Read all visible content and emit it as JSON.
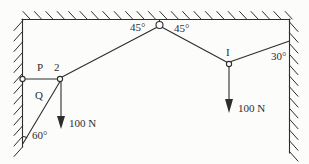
{
  "diagram": {
    "colors": {
      "ink": "#2d2d2d",
      "paper": "#fcfcfb"
    },
    "labels": {
      "point_P": "P",
      "point_2": "2",
      "string_Q": "Q",
      "point_I": "I",
      "angle_left_of_pulley": "45°",
      "angle_right_of_pulley": "45°",
      "angle_at_right_wall": "30°",
      "angle_at_left_wall": "60°",
      "force_at_left_knot": "100 N",
      "force_at_right_knot": "100 N"
    }
  }
}
